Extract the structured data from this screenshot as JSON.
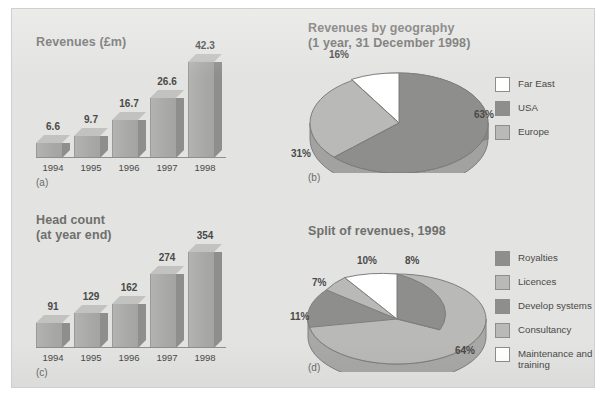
{
  "page": {
    "background": "#ffffff",
    "panel_background": "#e3e3e1",
    "panel_border": "#cfcfcd"
  },
  "palette": {
    "dark_gray": "#8e8e8c",
    "light_gray": "#b9b9b7",
    "white": "#ffffff",
    "title_text": "#6f6f6d",
    "body_text": "#4a4a48"
  },
  "charts": {
    "a": {
      "caption": "(a)",
      "chart_data": {
        "type": "bar",
        "title": "Revenues (£m)",
        "xlabel": "",
        "ylabel": "",
        "categories": [
          "1994",
          "1995",
          "1996",
          "1997",
          "1998"
        ],
        "values": [
          6.6,
          9.7,
          16.7,
          26.6,
          42.3
        ],
        "value_labels": [
          "6.6",
          "9.7",
          "16.7",
          "26.6",
          "42.3"
        ],
        "ylim": [
          0,
          42.3
        ],
        "grid": false,
        "legend": "none",
        "style": "3d-column"
      }
    },
    "b": {
      "caption": "(b)",
      "chart_data": {
        "type": "pie",
        "title": "Revenues by geography\n(1 year, 31 December 1998)",
        "style": "3d-pie",
        "legend": "right",
        "slices": [
          {
            "label": "USA",
            "value": 63,
            "pct_label": "63%",
            "color": "#8e8e8c"
          },
          {
            "label": "Europe",
            "value": 31,
            "pct_label": "31%",
            "color": "#b9b9b7"
          },
          {
            "label": "Far East",
            "value": 16,
            "pct_label": "16%",
            "color": "#ffffff"
          }
        ],
        "legend_entries": [
          {
            "label": "Far East",
            "color": "#ffffff"
          },
          {
            "label": "USA",
            "color": "#8e8e8c"
          },
          {
            "label": "Europe",
            "color": "#b9b9b7"
          }
        ]
      }
    },
    "c": {
      "caption": "(c)",
      "chart_data": {
        "type": "bar",
        "title": "Head count\n(at year end)",
        "xlabel": "",
        "ylabel": "",
        "categories": [
          "1994",
          "1995",
          "1996",
          "1997",
          "1998"
        ],
        "values": [
          91,
          129,
          162,
          274,
          354
        ],
        "value_labels": [
          "91",
          "129",
          "162",
          "274",
          "354"
        ],
        "ylim": [
          0,
          354
        ],
        "grid": false,
        "legend": "none",
        "style": "3d-column"
      }
    },
    "d": {
      "caption": "(d)",
      "chart_data": {
        "type": "pie",
        "title": "Split of revenues, 1998",
        "style": "3d-pie",
        "legend": "right",
        "slices": [
          {
            "label": "Royalties",
            "value": 8,
            "pct_label": "8%",
            "color": "#8e8e8c"
          },
          {
            "label": "Licences",
            "value": 64,
            "pct_label": "64%",
            "color": "#b9b9b7"
          },
          {
            "label": "Develop systems",
            "value": 11,
            "pct_label": "11%",
            "color": "#8e8e8c"
          },
          {
            "label": "Consultancy",
            "value": 7,
            "pct_label": "7%",
            "color": "#b9b9b7"
          },
          {
            "label": "Maintenance and training",
            "value": 10,
            "pct_label": "10%",
            "color": "#ffffff"
          }
        ],
        "legend_entries": [
          {
            "label": "Royalties",
            "color": "#8e8e8c"
          },
          {
            "label": "Licences",
            "color": "#b9b9b7"
          },
          {
            "label": "Develop systems",
            "color": "#8e8e8c"
          },
          {
            "label": "Consultancy",
            "color": "#b9b9b7"
          },
          {
            "label": "Maintenance and\ntraining",
            "color": "#ffffff"
          }
        ]
      }
    }
  }
}
